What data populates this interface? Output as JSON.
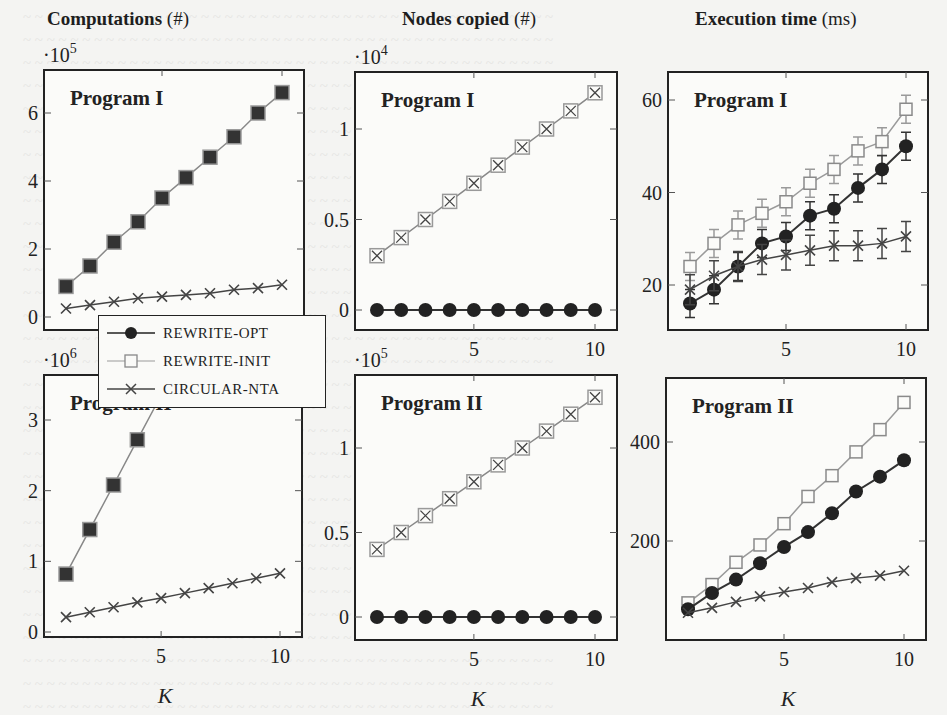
{
  "figure": {
    "columns": [
      {
        "title": "Computations",
        "unit": "(#)"
      },
      {
        "title": "Nodes copied",
        "unit": "(#)"
      },
      {
        "title": "Execution time",
        "unit": "(ms)"
      }
    ],
    "xlabel": "K",
    "legend": [
      {
        "label": "REWRITE-OPT",
        "marker": "filled-circle",
        "color": "#222222"
      },
      {
        "label": "REWRITE-INIT",
        "marker": "open-square",
        "color": "#8a8a8a"
      },
      {
        "label": "CIRCULAR-NTA",
        "marker": "x-cross",
        "color": "#444444"
      }
    ]
  },
  "chart_data": [
    {
      "type": "line",
      "title": "Computations (#) — Program I",
      "panel_label": "Program I",
      "xlabel": "K",
      "ylabel": "",
      "y_multiplier": "·10^5",
      "ylim": [
        -0.5,
        7.0
      ],
      "yticks": [
        0,
        2,
        4,
        6
      ],
      "xticks": [
        5,
        10
      ],
      "x": [
        1,
        2,
        3,
        4,
        5,
        6,
        7,
        8,
        9,
        10
      ],
      "series": [
        {
          "name": "REWRITE-OPT / REWRITE-INIT (overlapping)",
          "marker": "square-overlap",
          "values": [
            0.9,
            1.5,
            2.2,
            2.8,
            3.5,
            4.1,
            4.7,
            5.3,
            6.0,
            6.6
          ]
        },
        {
          "name": "CIRCULAR-NTA",
          "marker": "x",
          "values": [
            0.25,
            0.35,
            0.45,
            0.55,
            0.6,
            0.65,
            0.7,
            0.8,
            0.85,
            0.95
          ]
        }
      ]
    },
    {
      "type": "line",
      "title": "Nodes copied (#) — Program I",
      "panel_label": "Program I",
      "xlabel": "K",
      "y_multiplier": "·10^4",
      "ylim": [
        -0.12,
        1.3
      ],
      "yticks": [
        0,
        0.5,
        1
      ],
      "xticks": [
        5,
        10
      ],
      "x": [
        1,
        2,
        3,
        4,
        5,
        6,
        7,
        8,
        9,
        10
      ],
      "series": [
        {
          "name": "REWRITE-INIT / CIRCULAR-NTA (overlapping)",
          "marker": "square-x",
          "values": [
            0.3,
            0.4,
            0.5,
            0.6,
            0.7,
            0.8,
            0.9,
            1.0,
            1.1,
            1.2
          ]
        },
        {
          "name": "REWRITE-OPT",
          "marker": "circle",
          "values": [
            0,
            0,
            0,
            0,
            0,
            0,
            0,
            0,
            0,
            0
          ]
        }
      ]
    },
    {
      "type": "line",
      "title": "Execution time (ms) — Program I",
      "panel_label": "Program I",
      "xlabel": "K",
      "ylim": [
        10,
        65
      ],
      "yticks": [
        20,
        40,
        60
      ],
      "xticks": [
        5,
        10
      ],
      "error_bars": true,
      "x": [
        1,
        2,
        3,
        4,
        5,
        6,
        7,
        8,
        9,
        10
      ],
      "series": [
        {
          "name": "REWRITE-INIT",
          "marker": "square",
          "values": [
            24,
            29,
            33,
            35.5,
            38,
            42,
            45,
            49,
            51,
            58
          ]
        },
        {
          "name": "REWRITE-OPT",
          "marker": "circle",
          "values": [
            16,
            19,
            24,
            29,
            30.5,
            35,
            36.5,
            41,
            45,
            50
          ]
        },
        {
          "name": "CIRCULAR-NTA",
          "marker": "x",
          "values": [
            19,
            22,
            24,
            25.5,
            26.5,
            27.5,
            28.5,
            28.5,
            29,
            30.5
          ]
        }
      ]
    },
    {
      "type": "line",
      "title": "Computations (#) — Program II",
      "panel_label": "Program II",
      "xlabel": "K",
      "y_multiplier": "·10^6",
      "ylim": [
        -0.07,
        3.65
      ],
      "yticks": [
        0,
        1,
        2,
        3
      ],
      "xticks": [
        5,
        10
      ],
      "x": [
        1,
        2,
        3,
        4,
        5,
        6,
        7,
        8,
        9,
        10
      ],
      "series": [
        {
          "name": "REWRITE-OPT / REWRITE-INIT (overlapping)",
          "marker": "square-overlap",
          "values": [
            0.82,
            1.45,
            2.08,
            2.72,
            3.35,
            null,
            null,
            null,
            null,
            null
          ]
        },
        {
          "name": "CIRCULAR-NTA",
          "marker": "x",
          "values": [
            0.21,
            0.28,
            0.35,
            0.42,
            0.48,
            0.55,
            0.62,
            0.69,
            0.76,
            0.83
          ]
        }
      ]
    },
    {
      "type": "line",
      "title": "Nodes copied (#) — Program II",
      "panel_label": "Program II",
      "xlabel": "K",
      "y_multiplier": "·10^5",
      "ylim": [
        -0.13,
        1.42
      ],
      "yticks": [
        0,
        0.5,
        1
      ],
      "xticks": [
        5,
        10
      ],
      "x": [
        1,
        2,
        3,
        4,
        5,
        6,
        7,
        8,
        9,
        10
      ],
      "series": [
        {
          "name": "REWRITE-INIT / CIRCULAR-NTA (overlapping)",
          "marker": "square-x",
          "values": [
            0.4,
            0.5,
            0.6,
            0.7,
            0.8,
            0.9,
            1.0,
            1.1,
            1.2,
            1.3
          ]
        },
        {
          "name": "REWRITE-OPT",
          "marker": "circle",
          "values": [
            0,
            0,
            0,
            0,
            0,
            0,
            0,
            0,
            0,
            0
          ]
        }
      ]
    },
    {
      "type": "line",
      "title": "Execution time (ms) — Program II",
      "panel_label": "Program II",
      "xlabel": "K",
      "ylim": [
        0,
        530
      ],
      "yticks": [
        200,
        400
      ],
      "xticks": [
        5,
        10
      ],
      "x": [
        1,
        2,
        3,
        4,
        5,
        6,
        7,
        8,
        9,
        10
      ],
      "series": [
        {
          "name": "REWRITE-INIT",
          "marker": "square",
          "values": [
            75,
            112,
            157,
            192,
            235,
            290,
            332,
            380,
            425,
            480
          ]
        },
        {
          "name": "REWRITE-OPT",
          "marker": "circle",
          "values": [
            62,
            95,
            122,
            155,
            188,
            218,
            256,
            300,
            330,
            363
          ]
        },
        {
          "name": "CIRCULAR-NTA",
          "marker": "x",
          "values": [
            55,
            65,
            77,
            88,
            97,
            105,
            117,
            125,
            130,
            140
          ]
        }
      ]
    }
  ]
}
